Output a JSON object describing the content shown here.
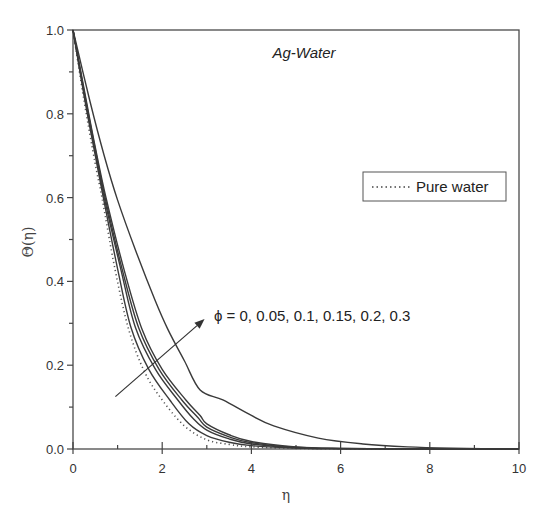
{
  "chart_data": {
    "type": "line",
    "title": "Ag-Water",
    "xlabel": "η",
    "ylabel": "Θ(η)",
    "xlim": [
      0,
      10
    ],
    "ylim": [
      0,
      1.0
    ],
    "xticks": [
      0,
      2,
      4,
      6,
      8,
      10
    ],
    "yticks": [
      0.0,
      0.2,
      0.4,
      0.6,
      0.8,
      1.0
    ],
    "xtick_labels": [
      "0",
      "2",
      "4",
      "6",
      "8",
      "10"
    ],
    "ytick_labels": [
      "0.0",
      "0.2",
      "0.4",
      "0.6",
      "0.8",
      "1.0"
    ],
    "grid": false,
    "legend": {
      "position": "upper right",
      "entries": [
        {
          "label": "Pure water",
          "style": "dotted"
        }
      ]
    },
    "annotation": {
      "text": "ϕ = 0, 0.05, 0.1, 0.15, 0.2, 0.3",
      "arrow": {
        "from": [
          0.95,
          0.125
        ],
        "to": [
          2.95,
          0.31
        ]
      }
    },
    "series": [
      {
        "name": "Pure water (ϕ = 0)",
        "style": "dotted",
        "x": [
          0,
          0.25,
          0.5,
          0.65,
          0.94,
          1.25,
          1.6,
          2.0,
          2.5,
          3.0,
          3.5,
          4.0,
          5.0,
          6.0,
          8.0,
          10.0
        ],
        "y": [
          1.0,
          0.83,
          0.68,
          0.6,
          0.43,
          0.285,
          0.185,
          0.117,
          0.055,
          0.022,
          0.011,
          0.005,
          0.0015,
          0.0005,
          0.0,
          0.0
        ]
      },
      {
        "name": "ϕ = 0.05",
        "style": "solid",
        "x": [
          0,
          0.27,
          0.5,
          0.68,
          1.0,
          1.3,
          1.7,
          2.17,
          2.6,
          3.0,
          3.5,
          4.0,
          5.0,
          6.0,
          8.0,
          10.0
        ],
        "y": [
          1.0,
          0.83,
          0.7,
          0.6,
          0.43,
          0.29,
          0.19,
          0.117,
          0.06,
          0.032,
          0.016,
          0.008,
          0.002,
          0.0007,
          0.0,
          0.0
        ]
      },
      {
        "name": "ϕ = 0.1",
        "style": "solid",
        "x": [
          0,
          0.28,
          0.5,
          0.7,
          1.07,
          1.4,
          1.85,
          2.35,
          2.7,
          3.0,
          3.5,
          4.0,
          5.0,
          6.0,
          8.0,
          10.0
        ],
        "y": [
          1.0,
          0.83,
          0.71,
          0.6,
          0.43,
          0.29,
          0.19,
          0.117,
          0.072,
          0.045,
          0.024,
          0.012,
          0.003,
          0.001,
          0.0,
          0.0
        ]
      },
      {
        "name": "ϕ = 0.15",
        "style": "solid",
        "x": [
          0,
          0.29,
          0.5,
          0.72,
          1.1,
          1.47,
          1.93,
          2.44,
          2.8,
          3.0,
          3.5,
          4.0,
          5.0,
          6.0,
          8.0,
          10.0
        ],
        "y": [
          1.0,
          0.83,
          0.715,
          0.6,
          0.43,
          0.29,
          0.19,
          0.117,
          0.075,
          0.052,
          0.029,
          0.015,
          0.004,
          0.0012,
          0.0,
          0.0
        ]
      },
      {
        "name": "ϕ = 0.2",
        "style": "solid",
        "x": [
          0,
          0.3,
          0.5,
          0.74,
          1.14,
          1.55,
          2.0,
          2.53,
          2.85,
          3.0,
          3.5,
          4.0,
          5.0,
          6.0,
          8.0,
          10.0
        ],
        "y": [
          1.0,
          0.83,
          0.72,
          0.6,
          0.43,
          0.285,
          0.19,
          0.117,
          0.08,
          0.06,
          0.034,
          0.018,
          0.005,
          0.0015,
          0.0,
          0.0
        ]
      },
      {
        "name": "ϕ = 0.3",
        "style": "solid",
        "x": [
          0,
          0.38,
          0.7,
          1.0,
          1.4,
          1.84,
          2.13,
          2.5,
          2.85,
          3.36,
          4.0,
          4.5,
          5.5,
          6.5,
          7.5,
          8.5,
          10.0
        ],
        "y": [
          1.0,
          0.83,
          0.7,
          0.594,
          0.475,
          0.355,
          0.285,
          0.21,
          0.141,
          0.117,
          0.08,
          0.055,
          0.026,
          0.012,
          0.005,
          0.002,
          0.0
        ]
      }
    ]
  }
}
